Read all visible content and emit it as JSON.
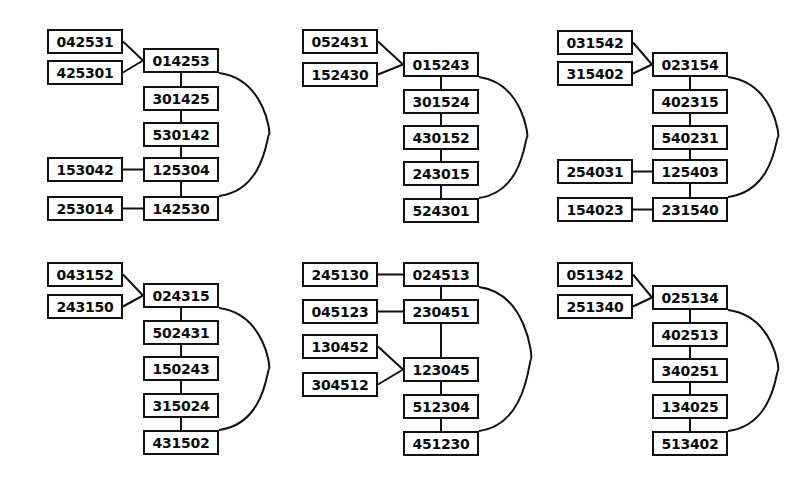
{
  "figure": {
    "width": 804,
    "height": 489,
    "background": "#ffffff",
    "ink": "#111111"
  },
  "panels": [
    {
      "id": "panel-top-left",
      "row": 0,
      "col": 0,
      "origin": {
        "x": 40,
        "y": 22
      },
      "main_chain": [
        {
          "label": "014253",
          "x": 143,
          "y": 48
        },
        {
          "label": "301425",
          "x": 143,
          "y": 86
        },
        {
          "label": "530142",
          "x": 143,
          "y": 122
        },
        {
          "label": "125304",
          "x": 143,
          "y": 157
        },
        {
          "label": "142530",
          "x": 143,
          "y": 196
        }
      ],
      "satellites": [
        {
          "label": "042531",
          "x": 47,
          "y": 29,
          "target": 0,
          "link": "diagonal-down"
        },
        {
          "label": "425301",
          "x": 47,
          "y": 60,
          "target": 0,
          "link": "diagonal-up"
        },
        {
          "label": "153042",
          "x": 47,
          "y": 157,
          "target": 3,
          "link": "horizontal"
        },
        {
          "label": "253014",
          "x": 47,
          "y": 196,
          "target": 4,
          "link": "horizontal"
        }
      ],
      "arc": {
        "from": 0,
        "to": 4,
        "bulge": 46
      }
    },
    {
      "id": "panel-top-middle",
      "row": 0,
      "col": 1,
      "origin": {
        "x": 296,
        "y": 22
      },
      "main_chain": [
        {
          "label": "015243",
          "x": 403,
          "y": 52
        },
        {
          "label": "301524",
          "x": 403,
          "y": 89
        },
        {
          "label": "430152",
          "x": 403,
          "y": 125
        },
        {
          "label": "243015",
          "x": 403,
          "y": 161
        },
        {
          "label": "524301",
          "x": 403,
          "y": 198
        }
      ],
      "satellites": [
        {
          "label": "052431",
          "x": 302,
          "y": 29,
          "target": 0,
          "link": "diagonal-down"
        },
        {
          "label": "152430",
          "x": 302,
          "y": 62,
          "target": 0,
          "link": "diagonal-up"
        }
      ],
      "arc": {
        "from": 0,
        "to": 4,
        "bulge": 44
      }
    },
    {
      "id": "panel-top-right",
      "row": 0,
      "col": 2,
      "origin": {
        "x": 552,
        "y": 22
      },
      "main_chain": [
        {
          "label": "023154",
          "x": 652,
          "y": 52
        },
        {
          "label": "402315",
          "x": 652,
          "y": 89
        },
        {
          "label": "540231",
          "x": 652,
          "y": 125
        },
        {
          "label": "125403",
          "x": 652,
          "y": 159
        },
        {
          "label": "231540",
          "x": 652,
          "y": 197
        }
      ],
      "satellites": [
        {
          "label": "031542",
          "x": 557,
          "y": 30,
          "target": 0,
          "link": "diagonal-down"
        },
        {
          "label": "315402",
          "x": 557,
          "y": 61,
          "target": 0,
          "link": "diagonal-up"
        },
        {
          "label": "254031",
          "x": 557,
          "y": 159,
          "target": 3,
          "link": "horizontal"
        },
        {
          "label": "154023",
          "x": 557,
          "y": 197,
          "target": 4,
          "link": "horizontal"
        }
      ],
      "arc": {
        "from": 0,
        "to": 4,
        "bulge": 46
      }
    },
    {
      "id": "panel-bottom-left",
      "row": 1,
      "col": 0,
      "origin": {
        "x": 40,
        "y": 258
      },
      "main_chain": [
        {
          "label": "024315",
          "x": 143,
          "y": 283
        },
        {
          "label": "502431",
          "x": 143,
          "y": 320
        },
        {
          "label": "150243",
          "x": 143,
          "y": 356
        },
        {
          "label": "315024",
          "x": 143,
          "y": 393
        },
        {
          "label": "431502",
          "x": 143,
          "y": 430
        }
      ],
      "satellites": [
        {
          "label": "043152",
          "x": 47,
          "y": 262,
          "target": 0,
          "link": "diagonal-down"
        },
        {
          "label": "243150",
          "x": 47,
          "y": 294,
          "target": 0,
          "link": "diagonal-up"
        }
      ],
      "arc": {
        "from": 0,
        "to": 4,
        "bulge": 46
      }
    },
    {
      "id": "panel-bottom-middle",
      "row": 1,
      "col": 1,
      "origin": {
        "x": 296,
        "y": 258
      },
      "main_chain": [
        {
          "label": "024513",
          "x": 403,
          "y": 262
        },
        {
          "label": "230451",
          "x": 403,
          "y": 299
        },
        {
          "label": "123045",
          "x": 403,
          "y": 357
        },
        {
          "label": "512304",
          "x": 403,
          "y": 394
        },
        {
          "label": "451230",
          "x": 403,
          "y": 431
        }
      ],
      "satellites": [
        {
          "label": "245130",
          "x": 302,
          "y": 262,
          "target": 0,
          "link": "horizontal"
        },
        {
          "label": "045123",
          "x": 302,
          "y": 299,
          "target": 1,
          "link": "horizontal"
        },
        {
          "label": "130452",
          "x": 302,
          "y": 334,
          "target": 2,
          "link": "diagonal-down"
        },
        {
          "label": "304512",
          "x": 302,
          "y": 372,
          "target": 2,
          "link": "diagonal-up"
        }
      ],
      "arc": {
        "from": 0,
        "to": 4,
        "bulge": 48
      }
    },
    {
      "id": "panel-bottom-right",
      "row": 1,
      "col": 2,
      "origin": {
        "x": 552,
        "y": 258
      },
      "main_chain": [
        {
          "label": "025134",
          "x": 652,
          "y": 285
        },
        {
          "label": "402513",
          "x": 652,
          "y": 322
        },
        {
          "label": "340251",
          "x": 652,
          "y": 358
        },
        {
          "label": "134025",
          "x": 652,
          "y": 394
        },
        {
          "label": "513402",
          "x": 652,
          "y": 431
        }
      ],
      "satellites": [
        {
          "label": "051342",
          "x": 557,
          "y": 262,
          "target": 0,
          "link": "diagonal-down"
        },
        {
          "label": "251340",
          "x": 557,
          "y": 294,
          "target": 0,
          "link": "diagonal-up"
        }
      ],
      "arc": {
        "from": 0,
        "to": 4,
        "bulge": 46
      }
    }
  ],
  "geometry": {
    "node_width": 76,
    "node_height": 25,
    "satellite_width": 76,
    "satellite_height": 25
  }
}
